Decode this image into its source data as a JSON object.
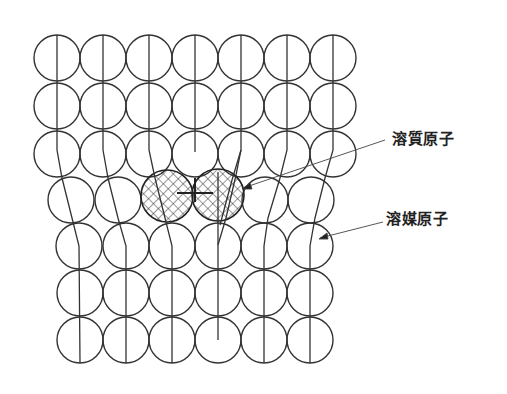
{
  "labels": {
    "solute_atom": "溶質原子",
    "solvent_atom": "溶媒原子"
  },
  "colors": {
    "line": "#333333",
    "background": "#ffffff"
  },
  "lattice": {
    "radius": 23,
    "rows": [
      {
        "y": 58,
        "xs": [
          57,
          103,
          149,
          195,
          241,
          287,
          333
        ]
      },
      {
        "y": 106,
        "xs": [
          57,
          103,
          149,
          195,
          241,
          287,
          333
        ]
      },
      {
        "y": 154,
        "xs": [
          57,
          103,
          149,
          195,
          241,
          287,
          333
        ]
      },
      {
        "y": 200,
        "xs": [
          71,
          118,
          265,
          311
        ]
      },
      {
        "y": 246,
        "xs": [
          79,
          126,
          172,
          218,
          264,
          310
        ]
      },
      {
        "y": 293,
        "xs": [
          80,
          126,
          172,
          218,
          264,
          310
        ]
      },
      {
        "y": 340,
        "xs": [
          80,
          126,
          172,
          218,
          264,
          310
        ]
      }
    ],
    "solute_atoms": [
      {
        "x": 167,
        "y": 196
      },
      {
        "x": 218,
        "y": 195
      }
    ]
  }
}
